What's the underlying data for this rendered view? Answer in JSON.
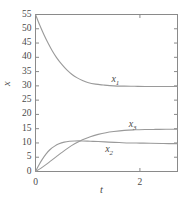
{
  "chart_data": {
    "type": "line",
    "title": "",
    "xlabel": "t",
    "ylabel": "x",
    "xlim": [
      0,
      2.72
    ],
    "ylim": [
      0,
      55
    ],
    "grid": false,
    "legend": "inline-curve-labels",
    "x_ticks": [
      0,
      2
    ],
    "x_tick_labels": [
      "0",
      "2"
    ],
    "x_minor_ticks": [],
    "y_ticks": [
      0,
      5,
      10,
      15,
      20,
      25,
      30,
      35,
      40,
      45,
      50,
      55
    ],
    "y_tick_labels": [
      "0",
      "5",
      "10",
      "15",
      "20",
      "25",
      "30",
      "35",
      "40",
      "45",
      "50",
      "55"
    ],
    "series": [
      {
        "name": "x1",
        "label": "x",
        "label_sub": "1",
        "label_x": 1.55,
        "label_y": 32.5,
        "start_value": 55,
        "end_value": 29.8,
        "shape": "exponential-decay",
        "x": [
          0,
          0.08,
          0.16,
          0.24,
          0.32,
          0.4,
          0.5,
          0.6,
          0.7,
          0.8,
          0.9,
          1.0,
          1.15,
          1.3,
          1.5,
          1.7,
          1.9,
          2.1,
          2.3,
          2.5,
          2.72
        ],
        "values": [
          55.0,
          51.3,
          48.0,
          45.0,
          42.3,
          40.0,
          37.6,
          35.6,
          34.0,
          32.8,
          31.9,
          31.2,
          30.6,
          30.3,
          30.0,
          29.9,
          29.85,
          29.8,
          29.8,
          29.8,
          29.8
        ]
      },
      {
        "name": "x2",
        "label": "x",
        "label_sub": "2",
        "label_x": 1.43,
        "label_y": 8.0,
        "start_value": 0,
        "end_value": 9.7,
        "shape": "saturating-fast",
        "x": [
          0,
          0.06,
          0.12,
          0.2,
          0.28,
          0.36,
          0.45,
          0.55,
          0.65,
          0.75,
          0.9,
          1.05,
          1.2,
          1.4,
          1.6,
          1.8,
          2.0,
          2.2,
          2.45,
          2.72
        ],
        "values": [
          0.0,
          2.1,
          4.0,
          6.1,
          7.7,
          8.8,
          9.7,
          10.3,
          10.6,
          10.7,
          10.7,
          10.6,
          10.5,
          10.3,
          10.15,
          10.0,
          9.95,
          9.9,
          9.8,
          9.75
        ]
      },
      {
        "name": "x3",
        "label": "x",
        "label_sub": "3",
        "label_x": 1.88,
        "label_y": 16.6,
        "start_value": 0,
        "end_value": 14.8,
        "shape": "sigmoidal-rise",
        "x": [
          0,
          0.1,
          0.2,
          0.3,
          0.4,
          0.5,
          0.62,
          0.75,
          0.9,
          1.05,
          1.2,
          1.35,
          1.5,
          1.7,
          1.9,
          2.1,
          2.3,
          2.5,
          2.72
        ],
        "values": [
          0.0,
          1.1,
          2.4,
          3.8,
          5.2,
          6.6,
          8.2,
          9.7,
          11.1,
          12.2,
          13.0,
          13.6,
          14.0,
          14.4,
          14.6,
          14.7,
          14.75,
          14.8,
          14.8
        ]
      }
    ],
    "colors": {
      "axis": "#8a8a8a",
      "curve": "#9a9a9a",
      "text": "#4a4a4a",
      "background": "#ffffff"
    }
  }
}
